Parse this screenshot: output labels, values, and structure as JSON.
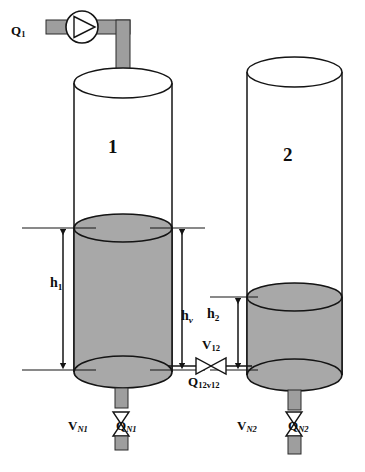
{
  "diagram": {
    "colors": {
      "line": "#1a1a1a",
      "liquid_fill": "#a8a8a8",
      "pipe_fill": "#9e9e9e",
      "background": "#ffffff"
    },
    "labels": {
      "inflow": {
        "base": "Q",
        "sub": "1"
      },
      "tank1": "1",
      "tank2": "2",
      "height1": {
        "base": "h",
        "sub": "1"
      },
      "height_valve": {
        "base": "h",
        "sub": "v"
      },
      "height2": {
        "base": "h",
        "sub": "2"
      },
      "valve12": {
        "base": "V",
        "sub": "12"
      },
      "flow12": {
        "base": "Q",
        "sub": "12v12"
      },
      "valve_n1": {
        "base": "V",
        "sub": "N1"
      },
      "flow_n1": {
        "base": "Q",
        "sub": "N1"
      },
      "valve_n2": {
        "base": "V",
        "sub": "N2"
      },
      "flow_n2": {
        "base": "Q",
        "sub": "N2"
      }
    },
    "components": {
      "pump": "pump-symbol",
      "inlet_pipe": "inlet-pipe",
      "tank1_body": "tank-1",
      "tank2_body": "tank-2",
      "tank1_liquid": "tank-1-liquid",
      "tank2_liquid": "tank-2-liquid",
      "coupling_valve": "coupling-valve-v12",
      "drain_valve_1": "drain-valve-n1",
      "drain_valve_2": "drain-valve-n2",
      "dim_arrow_h1": "dimension-arrow-h1",
      "dim_arrow_hv": "dimension-arrow-hv",
      "dim_arrow_h2": "dimension-arrow-h2"
    }
  }
}
